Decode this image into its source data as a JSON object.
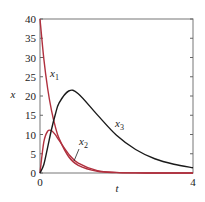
{
  "chart_data": {
    "type": "line",
    "title": "",
    "xlabel": "t",
    "ylabel": "x",
    "xlim": [
      0,
      4
    ],
    "ylim": [
      0,
      40
    ],
    "x_ticks": [
      0,
      4
    ],
    "x_tick_labels": [
      "0",
      "4"
    ],
    "y_ticks": [
      0,
      5,
      10,
      15,
      20,
      25,
      30,
      35,
      40
    ],
    "y_tick_labels": [
      "0",
      "5",
      "10",
      "15",
      "20",
      "25",
      "30",
      "35",
      "40"
    ],
    "grid": false,
    "legend": "inline labels",
    "x": [
      0,
      0.1,
      0.2,
      0.3,
      0.4,
      0.5,
      0.75,
      1,
      1.5,
      2,
      2.5,
      3,
      3.5,
      4
    ],
    "series": [
      {
        "name": "x1",
        "label_main": "x",
        "label_sub": "1",
        "color": "#b0303e",
        "values": [
          40,
          29.63,
          21.95,
          16.26,
          12.05,
          8.93,
          4.22,
          1.99,
          0.44,
          0.1,
          0.02,
          0.0,
          0.0,
          0.0
        ]
      },
      {
        "name": "x2",
        "label_main": "x",
        "label_sub": "2",
        "color": "#b0303e",
        "values": [
          0,
          8.06,
          10.85,
          11.01,
          9.95,
          8.46,
          4.91,
          2.58,
          0.63,
          0.15,
          0.03,
          0.01,
          0.0,
          0.0
        ]
      },
      {
        "name": "x3",
        "label_main": "x",
        "label_sub": "3",
        "color": "#1a1a1a",
        "values": [
          0,
          2.22,
          6.66,
          11.3,
          15.2,
          18.2,
          21.3,
          20.6,
          15.1,
          9.8,
          6.1,
          3.7,
          2.27,
          1.37
        ]
      }
    ],
    "annotations": [
      {
        "text": "x1",
        "near_t": 0.3,
        "near_x": 25
      },
      {
        "text": "x2",
        "near_t": 1.05,
        "near_x": 8,
        "leader_line": true
      },
      {
        "text": "x3",
        "near_t": 2.05,
        "near_x": 12
      }
    ]
  }
}
